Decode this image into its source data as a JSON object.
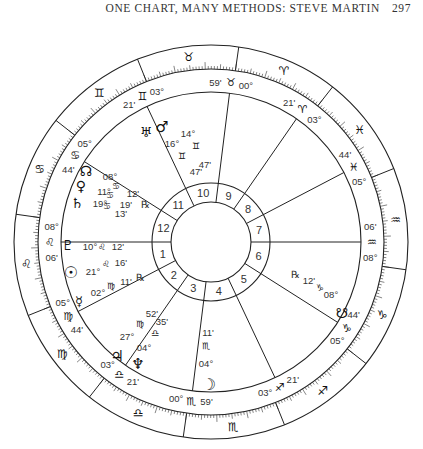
{
  "header": {
    "running_title": "ONE CHART, MANY METHODS: STEVE MARTIN",
    "page_number": "297"
  },
  "chart": {
    "center": [
      211,
      242
    ],
    "radii": {
      "outer": 197,
      "zodiac_inner": 173,
      "house_outer": 150,
      "hn_outer": 59,
      "hn_inner": 40
    },
    "ascendant_deg": 128.1,
    "cusps": [
      {
        "house": 1,
        "sign": "♌",
        "deg": "08°",
        "min": "06'",
        "lon": 128.1
      },
      {
        "house": 2,
        "sign": "♍",
        "deg": "05°",
        "min": "44'",
        "lon": 155.7
      },
      {
        "house": 3,
        "sign": "♎",
        "deg": "03°",
        "min": "21'",
        "lon": 183.35
      },
      {
        "house": 4,
        "sign": "♏",
        "deg": "00°",
        "min": "59'",
        "lon": 211.0
      },
      {
        "house": 5,
        "sign": "♐",
        "deg": "03°",
        "min": "21'",
        "lon": 243.35
      },
      {
        "house": 6,
        "sign": "♑",
        "deg": "05°",
        "min": "44'",
        "lon": 275.7
      },
      {
        "house": 7,
        "sign": "♒",
        "deg": "08°",
        "min": "06'",
        "lon": 308.1
      },
      {
        "house": 8,
        "sign": "♓",
        "deg": "05°",
        "min": "44'",
        "lon": 335.7
      },
      {
        "house": 9,
        "sign": "♈",
        "deg": "03°",
        "min": "21'",
        "lon": 3.35
      },
      {
        "house": 10,
        "sign": "♉",
        "deg": "00°",
        "min": "59'",
        "lon": 31.0
      },
      {
        "house": 11,
        "sign": "♊",
        "deg": "03°",
        "min": "21'",
        "lon": 63.35
      },
      {
        "house": 12,
        "sign": "♋",
        "deg": "05°",
        "min": "44'",
        "lon": 95.7
      }
    ],
    "zodiac_signs": [
      "♈",
      "♉",
      "♊",
      "♋",
      "♌",
      "♍",
      "♎",
      "♏",
      "♐",
      "♑",
      "♒",
      "♓"
    ],
    "planets": [
      {
        "name": "Uranus",
        "glyph": "♅",
        "deg": "14°",
        "sign": "♊",
        "min": "47'",
        "retro": false
      },
      {
        "name": "Mars",
        "glyph": "♂",
        "deg": "16°",
        "sign": "♊",
        "min": "47'",
        "retro": false
      },
      {
        "name": "North Node",
        "glyph": "☊",
        "deg": "08°",
        "sign": "♋",
        "min": "12'",
        "retro": false
      },
      {
        "name": "Venus",
        "glyph": "♀",
        "deg": "11°",
        "sign": "♋",
        "min": "19'",
        "retro": false
      },
      {
        "name": "Saturn",
        "glyph": "♄",
        "deg": "19°",
        "sign": "♋",
        "min": "13'",
        "retro": true
      },
      {
        "name": "Pluto",
        "glyph": "♇",
        "deg": "10°",
        "sign": "♌",
        "min": "12'",
        "retro": false
      },
      {
        "name": "Sun",
        "glyph": "☉",
        "deg": "21°",
        "sign": "♌",
        "min": "16'",
        "retro": false
      },
      {
        "name": "Mercury",
        "glyph": "☿",
        "deg": "02°",
        "sign": "♍",
        "min": "11'",
        "retro": true
      },
      {
        "name": "Jupiter",
        "glyph": "♃",
        "deg": "27°",
        "sign": "♍",
        "min": "52'",
        "retro": false
      },
      {
        "name": "Neptune",
        "glyph": "♆",
        "deg": "04°",
        "sign": "♎",
        "min": "35'",
        "retro": false
      },
      {
        "name": "Moon",
        "glyph": "☽",
        "deg": "04°",
        "sign": "♏",
        "min": "11'",
        "retro": false
      },
      {
        "name": "South Node",
        "glyph": "☋",
        "deg": "08°",
        "sign": "♑",
        "min": "12'",
        "retro": true
      }
    ],
    "retrograde_symbol": "℞"
  }
}
